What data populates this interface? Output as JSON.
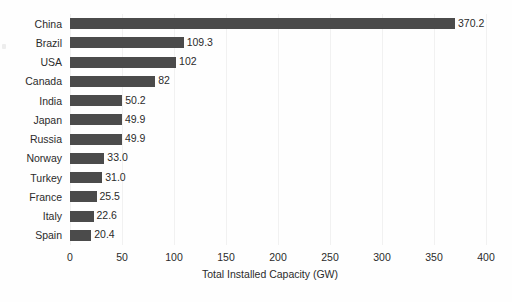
{
  "chart_data": {
    "type": "bar",
    "orientation": "horizontal",
    "title": "",
    "xlabel": "Total Installed Capacity (GW)",
    "ylabel": "",
    "xlim": [
      0,
      400
    ],
    "xticks": [
      0,
      50,
      100,
      150,
      200,
      250,
      300,
      350,
      400
    ],
    "xtick_labels": [
      "0",
      "50",
      "100",
      "150",
      "200",
      "250",
      "300",
      "350",
      "400"
    ],
    "grid": "vertical",
    "legend": null,
    "bar_color": "#4b4b4b",
    "categories": [
      "China",
      "Brazil",
      "USA",
      "Canada",
      "India",
      "Japan",
      "Russia",
      "Norway",
      "Turkey",
      "France",
      "Italy",
      "Spain"
    ],
    "values": [
      370.2,
      109.3,
      102,
      82,
      50.2,
      49.9,
      49.9,
      33.0,
      31.0,
      25.5,
      22.6,
      20.4
    ],
    "value_labels": [
      "370.2",
      "109.3",
      "102",
      "82",
      "50.2",
      "49.9",
      "49.9",
      "33.0",
      "31.0",
      "25.5",
      "22.6",
      "20.4"
    ]
  }
}
